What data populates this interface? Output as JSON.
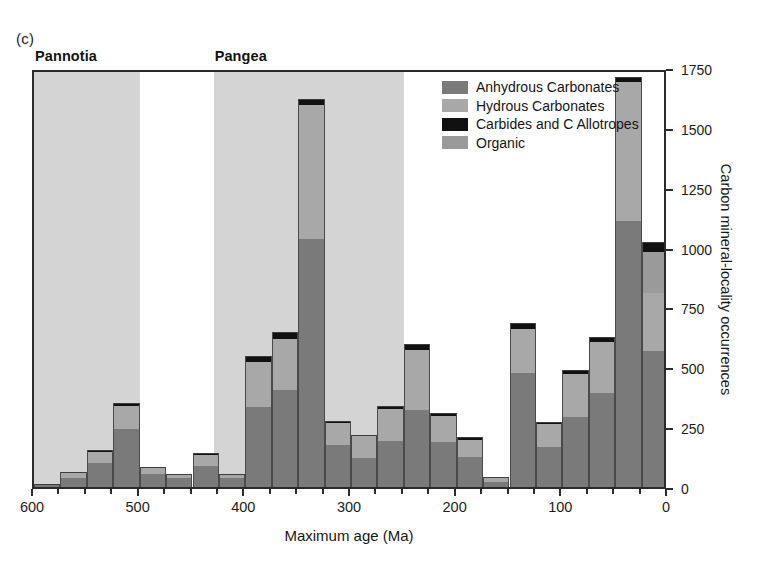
{
  "figure": {
    "panel_label": "(c)"
  },
  "bands": [
    {
      "name": "Pannotia",
      "label": "Pannotia",
      "start_ma": 600,
      "end_ma": 500
    },
    {
      "name": "Pangea",
      "label": "Pangea",
      "start_ma": 430,
      "end_ma": 250
    }
  ],
  "legend": {
    "position": "top-center-right",
    "entries": [
      {
        "label": "Anhydrous Carbonates",
        "color": "#7a7a7a",
        "key": "anhydrous"
      },
      {
        "label": "Hydrous Carbonates",
        "color": "#a8a8a8",
        "key": "hydrous"
      },
      {
        "label": "Carbides and C Allotropes",
        "color": "#111111",
        "key": "carbide"
      },
      {
        "label": "Organic",
        "color": "#9a9a9a",
        "key": "organic"
      }
    ]
  },
  "chart_data": {
    "type": "bar",
    "stacked": true,
    "title": "",
    "subtitle": "",
    "xlabel": "Maximum age (Ma)",
    "ylabel": "Carbon mineral-locality occurrences",
    "xlim": [
      600,
      0
    ],
    "ylim": [
      0,
      1750
    ],
    "x_reversed": true,
    "grid": false,
    "bin_width_ma": 25,
    "xticks": [
      600,
      500,
      400,
      300,
      200,
      100,
      0
    ],
    "xtick_labels": [
      "600",
      "500",
      "400",
      "300",
      "200",
      "100",
      "0"
    ],
    "x_minor_tick_step": 25,
    "yticks": [
      0,
      250,
      500,
      750,
      1000,
      1250,
      1500,
      1750
    ],
    "ytick_labels": [
      "0",
      "250",
      "500",
      "750",
      "1000",
      "1250",
      "1500",
      "1750"
    ],
    "categories": [
      600,
      575,
      550,
      525,
      500,
      475,
      450,
      425,
      400,
      375,
      350,
      325,
      300,
      275,
      250,
      225,
      200,
      175,
      150,
      125,
      100,
      75,
      50,
      25
    ],
    "category_labels": [
      "600-575",
      "575-550",
      "550-525",
      "525-500",
      "500-475",
      "475-450",
      "450-425",
      "425-400",
      "400-375",
      "375-350",
      "350-325",
      "325-300",
      "300-275",
      "275-250",
      "250-225",
      "225-200",
      "200-175",
      "175-150",
      "150-125",
      "125-100",
      "100-75",
      "75-50",
      "50-25",
      "25-0"
    ],
    "series": [
      {
        "name": "Anhydrous Carbonates",
        "color": "#7a7a7a",
        "values": [
          18,
          45,
          110,
          250,
          62,
          45,
          95,
          45,
          342,
          415,
          1045,
          185,
          130,
          200,
          330,
          195,
          135,
          28,
          485,
          175,
          300,
          400,
          1120,
          575
        ]
      },
      {
        "name": "Hydrous Carbonates",
        "color": "#a8a8a8",
        "values": [
          0,
          20,
          45,
          95,
          25,
          15,
          45,
          12,
          190,
          210,
          560,
          90,
          90,
          135,
          250,
          110,
          70,
          18,
          185,
          95,
          180,
          215,
          580,
          245
        ]
      },
      {
        "name": "Carbides and C Allotropes",
        "color": "#111111",
        "values": [
          2,
          4,
          8,
          16,
          5,
          4,
          9,
          4,
          22,
          30,
          22,
          8,
          7,
          12,
          24,
          12,
          12,
          4,
          22,
          10,
          16,
          18,
          20,
          40
        ]
      },
      {
        "name": "Organic",
        "color": "#9a9a9a",
        "values": [
          0,
          0,
          0,
          0,
          0,
          0,
          0,
          0,
          0,
          0,
          0,
          0,
          0,
          0,
          0,
          0,
          0,
          0,
          0,
          0,
          0,
          0,
          0,
          170
        ]
      }
    ],
    "totals": [
      20,
      69,
      163,
      361,
      92,
      64,
      149,
      61,
      554,
      655,
      1627,
      283,
      227,
      347,
      604,
      317,
      217,
      50,
      692,
      280,
      496,
      633,
      1720,
      1030
    ]
  }
}
